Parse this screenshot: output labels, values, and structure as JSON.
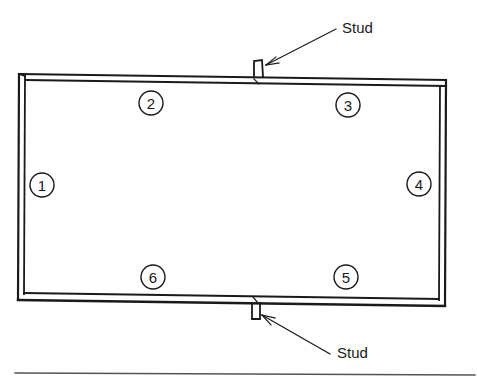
{
  "diagram": {
    "callouts": [
      {
        "id": "top-stud",
        "label": "Stud"
      },
      {
        "id": "bottom-stud",
        "label": "Stud"
      }
    ],
    "positions": [
      {
        "number": "1",
        "side": "left"
      },
      {
        "number": "2",
        "side": "top-left"
      },
      {
        "number": "3",
        "side": "top-right"
      },
      {
        "number": "4",
        "side": "right"
      },
      {
        "number": "5",
        "side": "bottom-right"
      },
      {
        "number": "6",
        "side": "bottom-left"
      }
    ],
    "colors": {
      "line": "#1a1a1a",
      "background": "#ffffff",
      "rule": "#555555"
    }
  }
}
